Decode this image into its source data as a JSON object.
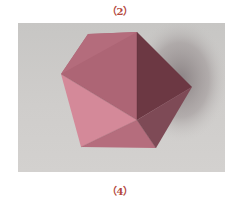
{
  "captions": {
    "top": "（2）",
    "bottom": "（4）"
  },
  "figure": {
    "colors": {
      "background": "#cbc9c7",
      "shadow": "#8f8688",
      "face_top": "#a8616f",
      "face_top_left": "#b86f80",
      "face_left": "#cf8595",
      "face_front_left": "#d88c9c",
      "face_front_bottom": "#b97080",
      "face_right_upper": "#6e3a45",
      "face_right_lower": "#7b4854",
      "face_right_bottom": "#8f5664",
      "caption": "#b4483c"
    }
  }
}
